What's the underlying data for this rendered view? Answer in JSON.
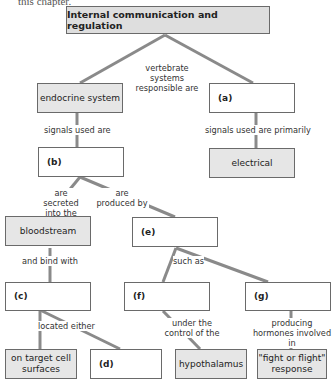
{
  "cutoff_text": "this chapter.",
  "colors": {
    "line": "#8a8a8a",
    "filled_box": "#e6e6e6",
    "title_box": "#dedede",
    "border": "#6a6a6a"
  },
  "nodes": {
    "title": "Internal communication and regulation",
    "endocrine": "endocrine system",
    "a": "(a)",
    "b": "(b)",
    "electrical": "electrical",
    "bloodstream": "bloodstream",
    "e": "(e)",
    "c": "(c)",
    "f": "(f)",
    "g": "(g)",
    "target_cell": "on target cell surfaces",
    "d": "(d)",
    "hypothalamus": "hypothalamus",
    "fight_flight": "\"fight or flight\" response"
  },
  "links": {
    "vertebrate": "vertebrate systems responsible are",
    "signals_used": "signals used are",
    "signals_primarily": "signals used are primarily",
    "secreted": "are secreted into the",
    "produced": "are produced by",
    "bind": "and bind with",
    "such_as": "such as",
    "located": "located either",
    "control": "under the control of the",
    "producing": "producing hormones involved in"
  }
}
